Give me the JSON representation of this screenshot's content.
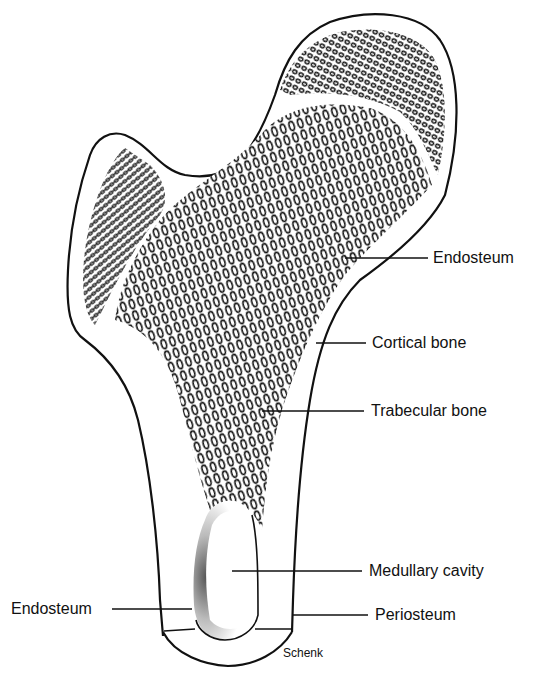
{
  "figure": {
    "credit": "Schenk",
    "colors": {
      "ink": "#111111",
      "background": "#ffffff"
    }
  },
  "labels": [
    {
      "id": "endosteum-upper",
      "text": "Endosteum"
    },
    {
      "id": "cortical-bone",
      "text": "Cortical bone"
    },
    {
      "id": "trabecular-bone",
      "text": "Trabecular bone"
    },
    {
      "id": "medullary-cavity",
      "text": "Medullary cavity"
    },
    {
      "id": "endosteum-lower",
      "text": "Endosteum"
    },
    {
      "id": "periosteum",
      "text": "Periosteum"
    }
  ]
}
